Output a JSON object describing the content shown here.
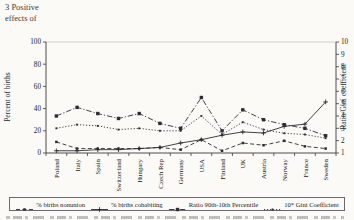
{
  "page": {
    "corner_text_line1": "3 Positive",
    "corner_text_line2": "effects of"
  },
  "chart_data": {
    "type": "line",
    "title": "",
    "categories": [
      "Poland",
      "Italy",
      "Spain",
      "Switzerland",
      "Hungary",
      "Czech Rep",
      "Germany",
      "USA",
      "Finland",
      "UK",
      "Austria",
      "Norway",
      "France",
      "Sweden"
    ],
    "series": [
      {
        "name": "% births nonunion",
        "axis": "left",
        "style": "dashed",
        "marker": "square-small",
        "values": [
          10,
          4,
          4,
          4,
          4,
          5,
          3,
          12,
          2,
          9,
          7,
          11,
          6,
          4
        ]
      },
      {
        "name": "% births cohabiting",
        "axis": "left",
        "style": "solid",
        "marker": "cross",
        "values": [
          2,
          2,
          3,
          3,
          4,
          5,
          9,
          12,
          16,
          19,
          18,
          24,
          26,
          46
        ]
      },
      {
        "name": "Ratio 90th-10th Percentile",
        "axis": "right",
        "style": "dashdot",
        "marker": "square",
        "values": [
          4.0,
          4.7,
          4.2,
          3.8,
          4.2,
          3.4,
          3.0,
          5.5,
          2.8,
          4.5,
          3.7,
          3.3,
          3.0,
          2.4
        ]
      },
      {
        "name": "10* Gini Coefficient",
        "axis": "right",
        "style": "dotted",
        "marker": "square-tiny",
        "values": [
          3.0,
          3.3,
          3.2,
          2.9,
          3.0,
          2.8,
          2.8,
          4.0,
          2.5,
          3.5,
          2.9,
          2.6,
          2.5,
          2.2
        ]
      }
    ],
    "left_axis": {
      "label": "Percent of births",
      "ticks": [
        0,
        20,
        40,
        60,
        80,
        100
      ],
      "range": [
        0,
        100
      ]
    },
    "right_axis": {
      "label": "Ratio/Gini coefficient",
      "ticks": [
        1,
        2,
        3,
        4,
        5,
        6,
        7,
        8,
        9,
        10
      ],
      "range": [
        1,
        10
      ]
    },
    "legend_position": "bottom",
    "grid": false,
    "line_color": "#2e2e2e",
    "frame_color": "#c8c6c0"
  }
}
